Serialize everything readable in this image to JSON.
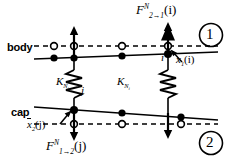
{
  "diagram": {
    "regions": [
      {
        "id": "region-1",
        "number": "1",
        "name": "body-region"
      },
      {
        "id": "region-2",
        "number": "2",
        "name": "cap-region"
      }
    ],
    "side_labels": {
      "body": "body",
      "cap": "cap"
    },
    "forces": {
      "top": {
        "symbol": "F",
        "superscript": "N",
        "subscript": "2→1",
        "argument": "(i)",
        "direction": "up"
      },
      "bottom": {
        "symbol": "F",
        "superscript": "N",
        "subscript": "1→2",
        "argument": "(j)",
        "direction": "down"
      }
    },
    "displacements": {
      "top": {
        "symbol": "x",
        "subscript": "1",
        "argument": "(i)",
        "overbar": false
      },
      "bottom": {
        "symbol": "x",
        "subscript": "2",
        "argument": "(j)",
        "overbar": true
      }
    },
    "springs": [
      {
        "name": "spring-left",
        "symbol": "K",
        "subscript": "N",
        "sub_subscript": "j"
      },
      {
        "name": "spring-right",
        "symbol": "K",
        "subscript": "N",
        "sub_subscript": "i"
      }
    ],
    "nodes": [
      {
        "name": "node-i",
        "label": "i"
      },
      {
        "name": "node-j",
        "label": "j"
      }
    ],
    "colors": {
      "stroke": "#000000",
      "background": "#ffffff"
    }
  }
}
